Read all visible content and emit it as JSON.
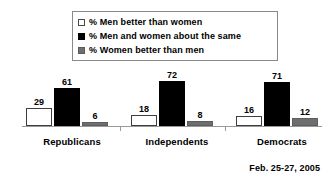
{
  "chart_data": {
    "type": "bar",
    "title": "",
    "subtitle": "",
    "xlabel": "",
    "ylabel": "",
    "ylim": [
      0,
      80
    ],
    "grid": false,
    "legend_position": "top-center",
    "categories": [
      "Republicans",
      "Independents",
      "Democrats"
    ],
    "series": [
      {
        "name": "% Men better than women",
        "swatch": "white",
        "color": "#ffffff",
        "values": [
          29,
          18,
          16
        ]
      },
      {
        "name": "% Men and women about the same",
        "swatch": "black",
        "color": "#000000",
        "values": [
          61,
          72,
          71
        ]
      },
      {
        "name": "% Women better than men",
        "swatch": "gray",
        "color": "#6e6e6e",
        "values": [
          6,
          8,
          12
        ]
      }
    ],
    "annotations": [
      "Feb. 25-27, 2005"
    ]
  },
  "legend": {
    "items": [
      {
        "label": "% Men better than women",
        "swatch": "white"
      },
      {
        "label": "% Men and women about the same",
        "swatch": "black"
      },
      {
        "label": "% Women better than men",
        "swatch": "gray"
      }
    ]
  },
  "axis": {
    "categories": [
      {
        "label": "Republicans"
      },
      {
        "label": "Independents"
      },
      {
        "label": "Democrats"
      }
    ]
  },
  "footnote": {
    "text": "Feb. 25-27, 2005"
  },
  "colors": {
    "series_white": "#ffffff",
    "series_black": "#000000",
    "series_gray": "#6e6e6e",
    "axis_line": "#9a9a9a",
    "legend_border": "#8a8a8a",
    "text": "#000000",
    "background": "#ffffff"
  }
}
